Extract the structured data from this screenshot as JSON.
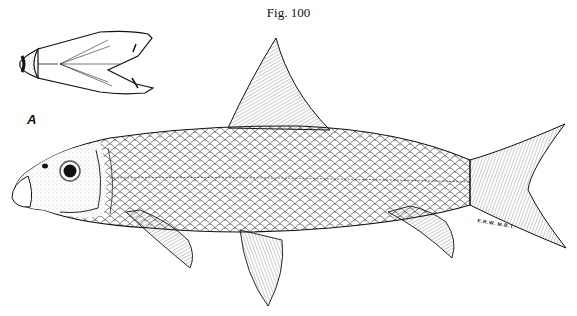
{
  "figure": {
    "caption": "Fig. 100",
    "inset_label": "A",
    "signature": "E.R.W.   M.B.T."
  },
  "illustration": {
    "subject": "fish-lateral-view",
    "inset": "head-ventral-view",
    "style": "pen-and-ink stipple and line engraving",
    "colors": {
      "ink": "#1a1a1a",
      "paper": "#ffffff"
    }
  }
}
